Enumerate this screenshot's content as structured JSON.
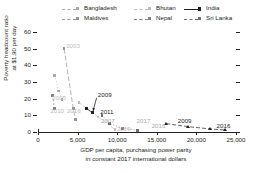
{
  "chart_data": {
    "type": "scatter",
    "title": "",
    "xlabel_lines": [
      "GDP per capita, purchasing power parity",
      "in constant 2017 international dollars"
    ],
    "ylabel_lines": [
      "Poverty headcount ratio",
      "at $1.90 per day"
    ],
    "xlim": [
      0,
      25000
    ],
    "ylim": [
      0,
      60
    ],
    "xticks": [
      0,
      5000,
      10000,
      15000,
      20000,
      25000
    ],
    "xticklabels": [
      "0",
      "5,000",
      "10,000",
      "15,000",
      "20,000",
      "25,000"
    ],
    "yticks": [
      0,
      10,
      20,
      30,
      40,
      50,
      60
    ],
    "yticklabels": [
      "0",
      "10",
      "20",
      "30",
      "40",
      "50",
      "60"
    ],
    "grid": false,
    "legend_position": "top",
    "series": [
      {
        "name": "Bangladesh",
        "color": "#a7a9ac",
        "dash": "1,2",
        "marker": "square",
        "points": [
          {
            "x": 2120,
            "y": 34.0,
            "label": "2005"
          },
          {
            "x": 2600,
            "y": 24.6,
            "label": ""
          },
          {
            "x": 3050,
            "y": 19.6,
            "label": "2016"
          }
        ]
      },
      {
        "name": "Bhutan",
        "color": "#bcbec0",
        "dash": "3,2",
        "marker": "square",
        "points": [
          {
            "x": 5200,
            "y": 17.6,
            "label": ""
          },
          {
            "x": 7600,
            "y": 9.0,
            "label": ""
          },
          {
            "x": 9700,
            "y": 1.5,
            "label": "2017"
          }
        ]
      },
      {
        "name": "India",
        "color": "#231f20",
        "dash": "4,2",
        "marker": "triangle",
        "points": [
          {
            "x": 16200,
            "y": 5.0,
            "label": "2009"
          },
          {
            "x": 19000,
            "y": 3.2,
            "label": ""
          },
          {
            "x": 21800,
            "y": 1.8,
            "label": ""
          },
          {
            "x": 23600,
            "y": 1.2,
            "label": "2016"
          }
        ]
      },
      {
        "name": "Maldives",
        "color": "#939598",
        "dash": "5,2",
        "marker": "square",
        "points": [
          {
            "x": 3300,
            "y": 50.0,
            "label": "2003"
          },
          {
            "x": 4450,
            "y": 14.0,
            "label": ""
          },
          {
            "x": 4750,
            "y": 7.6,
            "label": ""
          }
        ]
      },
      {
        "name": "Nepal",
        "color": "#808285",
        "dash": "2,2",
        "marker": "square",
        "points": [
          {
            "x": 1850,
            "y": 22.0,
            "label": "2010"
          },
          {
            "x": 2050,
            "y": 14.2,
            "label": ""
          }
        ]
      },
      {
        "name": "Sri Lanka",
        "color": "#6d6e71",
        "dash": "1,2",
        "marker": "square",
        "points": [
          {
            "x": 8100,
            "y": 10.0,
            "label": "2007"
          },
          {
            "x": 9000,
            "y": 5.2,
            "label": ""
          },
          {
            "x": 10700,
            "y": 2.2,
            "label": "2016"
          },
          {
            "x": 12600,
            "y": 1.0,
            "label": "2009"
          }
        ]
      }
    ],
    "highlight_series": {
      "name": "Bhutan-highlight",
      "color": "#231f20",
      "points": [
        {
          "x": 6100,
          "y": 14.0,
          "label": "2009"
        },
        {
          "x": 6900,
          "y": 11.6,
          "label": "2011"
        }
      ]
    },
    "annotations": [
      {
        "text": "2003",
        "x": 3300,
        "y": 51.5,
        "color": "#bcbec0",
        "anchor": "left"
      },
      {
        "text": "2005",
        "x": 1550,
        "y": 20.5,
        "color": "#bcbec0",
        "anchor": "left"
      },
      {
        "text": "2010",
        "x": 1300,
        "y": 12.8,
        "color": "#bcbec0",
        "anchor": "left"
      },
      {
        "text": "2016",
        "x": 3400,
        "y": 12.8,
        "color": "#bcbec0",
        "anchor": "left"
      },
      {
        "text": "2009",
        "x": 7300,
        "y": 22.5,
        "color": "#231f20",
        "anchor": "left"
      },
      {
        "text": "2011",
        "x": 7600,
        "y": 12.0,
        "color": "#231f20",
        "anchor": "left"
      },
      {
        "text": "2007",
        "x": 7700,
        "y": 6.6,
        "color": "#a7a9ac",
        "anchor": "left"
      },
      {
        "text": "2009",
        "x": 9700,
        "y": 1.6,
        "color": "#bcbec0",
        "anchor": "left"
      },
      {
        "text": "2017",
        "x": 12200,
        "y": 6.6,
        "color": "#a7a9ac",
        "anchor": "left"
      },
      {
        "text": "2016",
        "x": 14100,
        "y": 3.6,
        "color": "#a7a9ac",
        "anchor": "left"
      },
      {
        "text": "2009",
        "x": 17400,
        "y": 6.8,
        "color": "#231f20",
        "anchor": "left"
      },
      {
        "text": "2016",
        "x": 22300,
        "y": 3.6,
        "color": "#231f20",
        "anchor": "left"
      }
    ],
    "arrow": {
      "from": {
        "x": 7400,
        "y": 20.5
      },
      "to": {
        "x": 6950,
        "y": 12.6
      },
      "color": "#231f20"
    }
  },
  "legend": {
    "items": [
      {
        "label": "Bangladesh",
        "color": "#a7a9ac",
        "dash": "1,2",
        "col": 0,
        "row": 0
      },
      {
        "label": "Bhutan",
        "color": "#bcbec0",
        "dash": "3,2",
        "col": 1,
        "row": 0
      },
      {
        "label": "India",
        "color": "#231f20",
        "dash": "0",
        "col": 2,
        "row": 0
      },
      {
        "label": "Maldives",
        "color": "#939598",
        "dash": "5,2",
        "col": 0,
        "row": 1
      },
      {
        "label": "Nepal",
        "color": "#808285",
        "dash": "2,2",
        "col": 1,
        "row": 1
      },
      {
        "label": "Sri Lanka",
        "color": "#6d6e71",
        "dash": "1,2",
        "col": 2,
        "row": 1
      }
    ]
  }
}
